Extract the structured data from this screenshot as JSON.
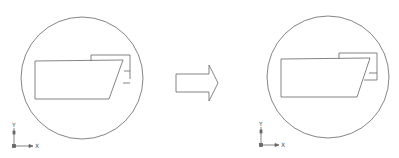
{
  "diagram": {
    "colors": {
      "line": "#555555",
      "background": "#ffffff"
    },
    "before": {
      "axis": {
        "x_label": "X",
        "y_label": "Y"
      }
    },
    "arrow": {
      "direction": "right",
      "icon": "block-arrow-right"
    },
    "after": {
      "axis": {
        "x_label": "X",
        "y_label": "Y"
      }
    }
  }
}
